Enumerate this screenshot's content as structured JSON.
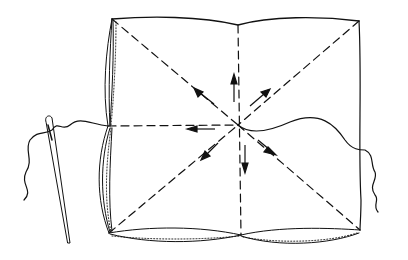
{
  "diagram": {
    "colors": {
      "ink": "#111111",
      "background": "#ffffff"
    },
    "elements": [
      "fabric-square",
      "fold-lines",
      "direction-arrows",
      "thread",
      "sewing-needle",
      "rolled-hem"
    ],
    "fold_lines": [
      "vertical",
      "horizontal",
      "diagonal-tl-br",
      "diagonal-tr-bl"
    ],
    "arrow_directions": [
      "up",
      "down",
      "left",
      "up-right",
      "up-left",
      "down-right",
      "down-left"
    ]
  }
}
